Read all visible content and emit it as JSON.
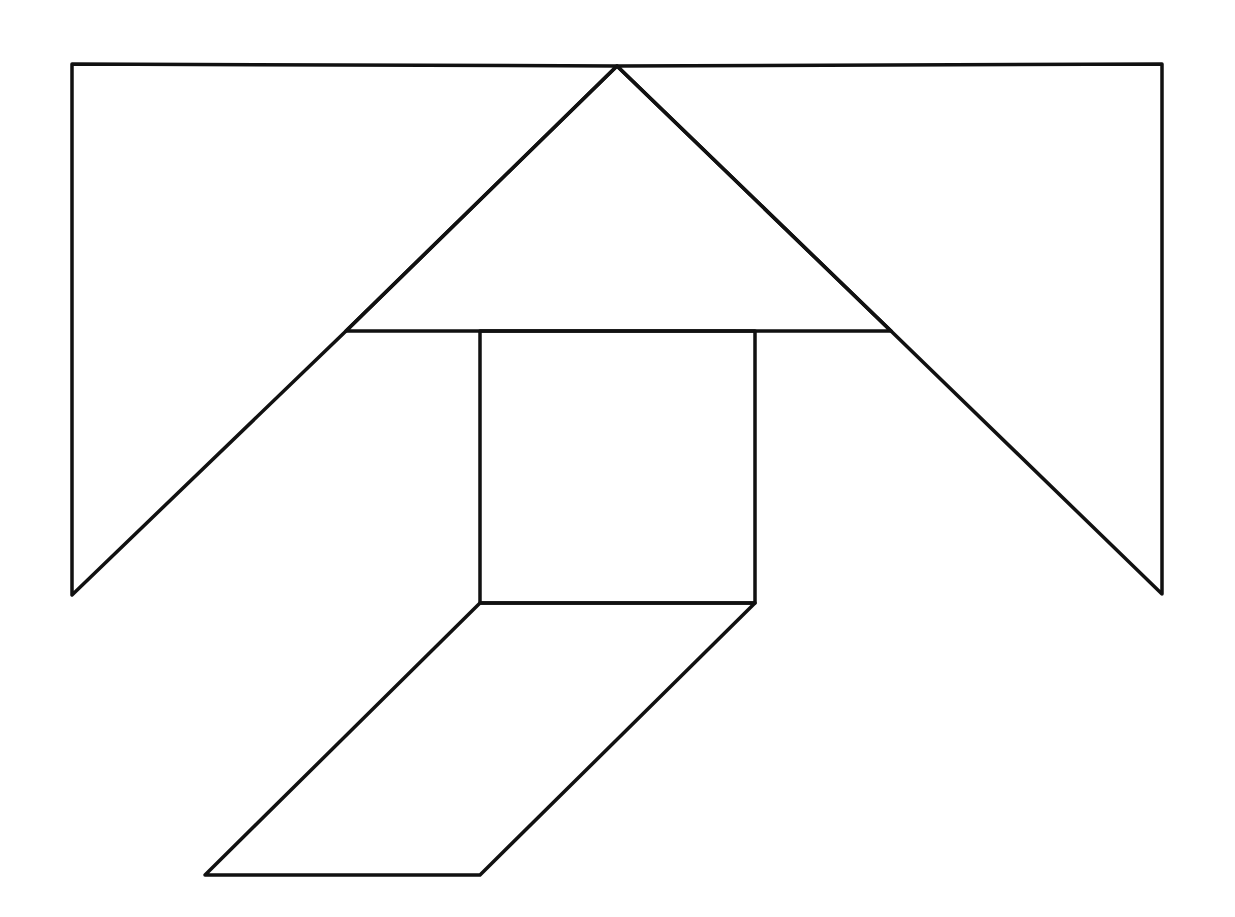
{
  "diagram": {
    "type": "tangram-figure",
    "background": "#ffffff",
    "stroke_color": "#111111",
    "stroke_width": 3.5,
    "pieces": [
      {
        "id": "left-trapezoid-piece",
        "shape": "quadrilateral",
        "points": [
          [
            72,
            64
          ],
          [
            617,
            66
          ],
          [
            346,
            331
          ],
          [
            72,
            595
          ]
        ]
      },
      {
        "id": "right-trapezoid-piece",
        "shape": "quadrilateral",
        "points": [
          [
            617,
            66
          ],
          [
            1162,
            64
          ],
          [
            1162,
            594
          ],
          [
            891,
            331
          ]
        ]
      },
      {
        "id": "center-triangle-piece",
        "shape": "triangle",
        "points": [
          [
            617,
            66
          ],
          [
            891,
            331
          ],
          [
            346,
            331
          ]
        ]
      },
      {
        "id": "square-piece",
        "shape": "square",
        "points": [
          [
            480,
            331
          ],
          [
            755,
            331
          ],
          [
            755,
            603
          ],
          [
            480,
            603
          ]
        ]
      },
      {
        "id": "parallelogram-piece",
        "shape": "parallelogram",
        "points": [
          [
            480,
            603
          ],
          [
            755,
            603
          ],
          [
            480,
            875
          ],
          [
            205,
            875
          ]
        ]
      }
    ]
  }
}
